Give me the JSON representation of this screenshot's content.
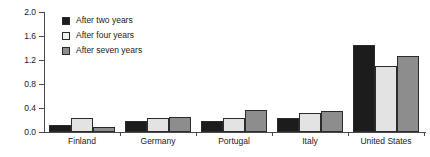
{
  "chart_data": {
    "type": "bar",
    "title": "",
    "subtitle": "",
    "xlabel": "",
    "ylabel": "",
    "ylim": [
      0.0,
      2.0
    ],
    "ytick_labels": [
      "0.0",
      "0.4",
      "0.8",
      "1.2",
      "1.6",
      "2.0"
    ],
    "ytick_values": [
      0.0,
      0.4,
      0.8,
      1.2,
      1.6,
      2.0
    ],
    "grid": false,
    "legend_position": "upper-left-inside",
    "categories": [
      "Finland",
      "Germany",
      "Portugal",
      "Italy",
      "United States"
    ],
    "series": [
      {
        "name": "After two years",
        "color": "#1c1c1c",
        "values": [
          0.12,
          0.18,
          0.18,
          0.24,
          1.45
        ]
      },
      {
        "name": "After four years",
        "color": "#e3e3e3",
        "values": [
          0.24,
          0.24,
          0.24,
          0.31,
          1.1
        ]
      },
      {
        "name": "After seven years",
        "color": "#8d8d8d",
        "values": [
          0.08,
          0.25,
          0.36,
          0.35,
          1.27
        ]
      }
    ]
  },
  "legend": {
    "items": [
      {
        "label": "After two years"
      },
      {
        "label": "After four years"
      },
      {
        "label": "After seven years"
      }
    ]
  },
  "axis": {
    "y_labels": [
      "2.0",
      "1.6",
      "1.2",
      "0.8",
      "0.4",
      "0.0"
    ],
    "x_labels": [
      "Finland",
      "Germany",
      "Portugal",
      "Italy",
      "United States"
    ]
  }
}
